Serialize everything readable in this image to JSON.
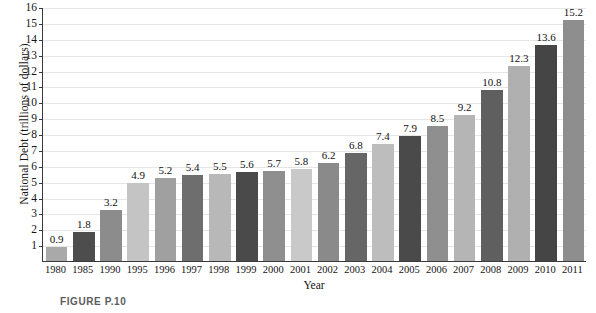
{
  "figure": {
    "caption": "FIGURE P.10"
  },
  "chart_data": {
    "type": "bar",
    "title": "",
    "xlabel": "Year",
    "ylabel": "National Debt (trillions of dollars)",
    "ylim": [
      0,
      16
    ],
    "ytick_start": 1,
    "ytick_end": 16,
    "ytick_step": 1,
    "yticks": [
      1,
      2,
      3,
      4,
      5,
      6,
      7,
      8,
      9,
      10,
      11,
      12,
      13,
      14,
      15,
      16
    ],
    "grid": true,
    "legend": "none",
    "categories": [
      "1980",
      "1985",
      "1990",
      "1995",
      "1996",
      "1997",
      "1998",
      "1999",
      "2000",
      "2001",
      "2002",
      "2003",
      "2004",
      "2005",
      "2006",
      "2007",
      "2008",
      "2009",
      "2010",
      "2011"
    ],
    "values": [
      0.9,
      1.8,
      3.2,
      4.9,
      5.2,
      5.4,
      5.5,
      5.6,
      5.7,
      5.8,
      6.2,
      6.8,
      7.4,
      7.9,
      8.5,
      9.2,
      10.8,
      12.3,
      13.6,
      15.2
    ],
    "value_labels": [
      "0.9",
      "1.8",
      "3.2",
      "4.9",
      "5.2",
      "5.4",
      "5.5",
      "5.6",
      "5.7",
      "5.8",
      "6.2",
      "6.8",
      "7.4",
      "7.9",
      "8.5",
      "9.2",
      "10.8",
      "12.3",
      "13.6",
      "15.2"
    ],
    "bar_colors": [
      "#a9a9a9",
      "#4d4d4d",
      "#8c8c8c",
      "#c4c4c4",
      "#a0a0a0",
      "#6e6e6e",
      "#b8b8b8",
      "#4a4a4a",
      "#8f8f8f",
      "#c9c9c9",
      "#8a8a8a",
      "#666666",
      "#bdbdbd",
      "#4a4a4a",
      "#8f8f8f",
      "#b5b5b5",
      "#5f5f5f",
      "#b0b0b0",
      "#454545",
      "#8e8e8e"
    ],
    "axis_color": "#3a3a3a",
    "gridline_color": "#e6e6e6",
    "background_color": "#ffffff"
  }
}
